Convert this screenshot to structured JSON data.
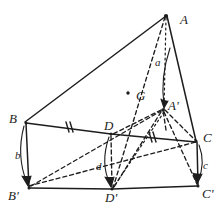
{
  "figure": {
    "kind": "hand-drawn-geometry-diagram",
    "ink_color": "#1d1d1d",
    "background_color": "#ffffff"
  },
  "points": {
    "A": {
      "label": "A",
      "x": 166,
      "y": 15,
      "label_x": 180,
      "label_y": 13
    },
    "B": {
      "label": "B",
      "x": 26,
      "y": 122,
      "label_x": 9,
      "label_y": 112
    },
    "C": {
      "label": "C",
      "x": 196,
      "y": 141,
      "label_x": 203,
      "label_y": 131
    },
    "D": {
      "label": "D",
      "x": 111,
      "y": 133,
      "label_x": 104,
      "label_y": 119
    },
    "Bp": {
      "label": "B'",
      "x": 30,
      "y": 188,
      "label_x": 10,
      "label_y": 189
    },
    "Cp": {
      "label": "C'",
      "x": 198,
      "y": 186,
      "label_x": 202,
      "label_y": 187
    },
    "Dp": {
      "label": "D'",
      "x": 112,
      "y": 189,
      "label_x": 106,
      "label_y": 191
    },
    "Ap": {
      "label": "A'",
      "x": 163,
      "y": 110,
      "label_x": 168,
      "label_y": 99
    },
    "G": {
      "label": "G",
      "x": 128,
      "y": 93,
      "label_x": 136,
      "label_y": 90
    }
  },
  "measure_labels": [
    {
      "name": "a",
      "text": "a",
      "x": 155,
      "y": 57
    },
    {
      "name": "b",
      "text": "b",
      "x": 15,
      "y": 150
    },
    {
      "name": "c",
      "text": "c",
      "x": 203,
      "y": 160
    },
    {
      "name": "d",
      "text": "d",
      "x": 96,
      "y": 161
    }
  ],
  "tick_marks": [
    {
      "name": "tick-bd",
      "x": 68,
      "y": 127,
      "count": 2,
      "on_segment": "B-D"
    },
    {
      "name": "tick-dc",
      "x": 152,
      "y": 137,
      "count": 2,
      "on_segment": "D-C"
    }
  ],
  "segments": {
    "solid": [
      {
        "name": "edge-A-B",
        "from": "A",
        "to": "B"
      },
      {
        "name": "edge-A-C",
        "from": "A",
        "to": "C"
      },
      {
        "name": "edge-B-D",
        "from": "B",
        "to": "D"
      },
      {
        "name": "edge-D-C",
        "from": "D",
        "to": "C"
      },
      {
        "name": "edge-B-Bp",
        "from": "B",
        "to": "Bp"
      },
      {
        "name": "edge-C-Cp",
        "from": "C",
        "to": "Cp"
      },
      {
        "name": "edge-Bp-Dp",
        "from": "Bp",
        "to": "Dp"
      },
      {
        "name": "edge-Dp-Cp",
        "from": "Dp",
        "to": "Cp"
      }
    ],
    "dashed": [
      {
        "name": "edge-A-Dp",
        "from": "A",
        "to": "Dp"
      },
      {
        "name": "edge-A-Ap",
        "from": "A",
        "to": "Ap"
      },
      {
        "name": "edge-D-Dp",
        "from": "D",
        "to": "Dp"
      },
      {
        "name": "edge-B-Cp",
        "from": "B",
        "to": "Cp"
      },
      {
        "name": "edge-Bp-Ap",
        "from": "Bp",
        "to": "Ap"
      },
      {
        "name": "edge-Ap-D",
        "from": "Ap",
        "to": "D"
      },
      {
        "name": "edge-Ap-Dp",
        "from": "Ap",
        "to": "Dp"
      },
      {
        "name": "edge-Ap-Cp",
        "from": "Ap",
        "to": "Cp"
      },
      {
        "name": "edge-Ap-C",
        "from": "Ap",
        "to": "C"
      }
    ]
  },
  "arrows": [
    {
      "name": "arrow-a",
      "label": "a",
      "from": "A",
      "to": "Ap"
    },
    {
      "name": "arrow-b",
      "label": "b",
      "from": "B",
      "to": "Bp"
    },
    {
      "name": "arrow-c",
      "label": "c",
      "from": "C",
      "to": "Cp"
    },
    {
      "name": "arrow-d",
      "label": "d",
      "from": "D",
      "to": "Dp"
    }
  ]
}
